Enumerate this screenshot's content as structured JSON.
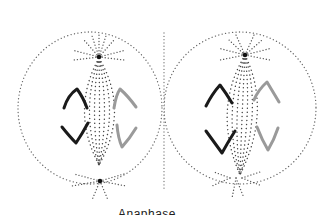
{
  "diagram": {
    "caption": "Anaphase",
    "cells": [
      {
        "name": "left-cell",
        "cx": 88,
        "cy": 110,
        "rx": 70,
        "ry": 78
      },
      {
        "name": "right-cell",
        "cx": 245,
        "cy": 110,
        "rx": 70,
        "ry": 78
      }
    ],
    "colors": {
      "background": "#ffffff",
      "outline_dots": "#555555",
      "spindle_dots": "#444444",
      "centrosome": "#111111",
      "chromosome_dark": "#1a1a1a",
      "chromosome_light": "#9a9a9a"
    }
  }
}
